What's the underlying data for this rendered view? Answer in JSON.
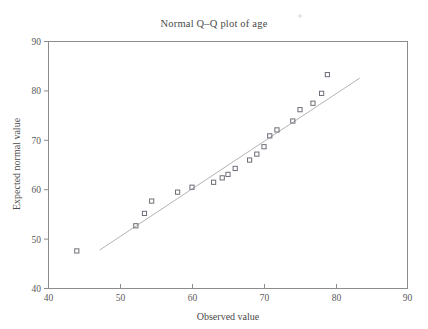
{
  "figure": {
    "width": 428,
    "height": 329,
    "background": "#ffffff",
    "title": "Normal Q–Q plot of age"
  },
  "axes": {
    "x": {
      "label": "Observed value",
      "min": 40,
      "max": 90,
      "ticks": [
        40,
        50,
        60,
        70,
        80,
        90
      ],
      "tick_labels": [
        "40",
        "50",
        "60",
        "70",
        "80",
        "90"
      ]
    },
    "y": {
      "label": "Expected normal value",
      "min": 40,
      "max": 90,
      "ticks": [
        40,
        50,
        60,
        70,
        80,
        90
      ],
      "tick_labels": [
        "40",
        "50",
        "60",
        "70",
        "80",
        "90"
      ]
    }
  },
  "colors": {
    "axis": "#8c8c8c",
    "marker_stroke": "#6e6e78",
    "reference_line": "#b4b4b4",
    "text": "#5a5a5a"
  },
  "chart_data": {
    "type": "scatter",
    "title": "Normal Q–Q plot of age",
    "xlabel": "Observed value",
    "ylabel": "Expected normal value",
    "xlim": [
      40,
      90
    ],
    "ylim": [
      40,
      90
    ],
    "grid": false,
    "legend": "none",
    "marker": "open-square",
    "series": [
      {
        "name": "age quantiles",
        "x": [
          44.0,
          52.2,
          53.4,
          54.4,
          58.0,
          60.0,
          63.0,
          64.2,
          65.0,
          66.0,
          68.0,
          69.0,
          70.0,
          70.8,
          71.8,
          74.0,
          75.0,
          76.8,
          78.0,
          78.8
        ],
        "y": [
          47.5,
          52.6,
          55.1,
          57.6,
          59.4,
          60.4,
          61.4,
          62.3,
          63.0,
          64.2,
          65.9,
          67.1,
          68.6,
          70.8,
          72.0,
          73.8,
          76.1,
          77.4,
          79.4,
          83.2
        ]
      }
    ],
    "reference_line": {
      "name": "normal reference line",
      "x": [
        47.2,
        83.3
      ],
      "y": [
        47.7,
        82.5
      ]
    },
    "annotations": []
  }
}
